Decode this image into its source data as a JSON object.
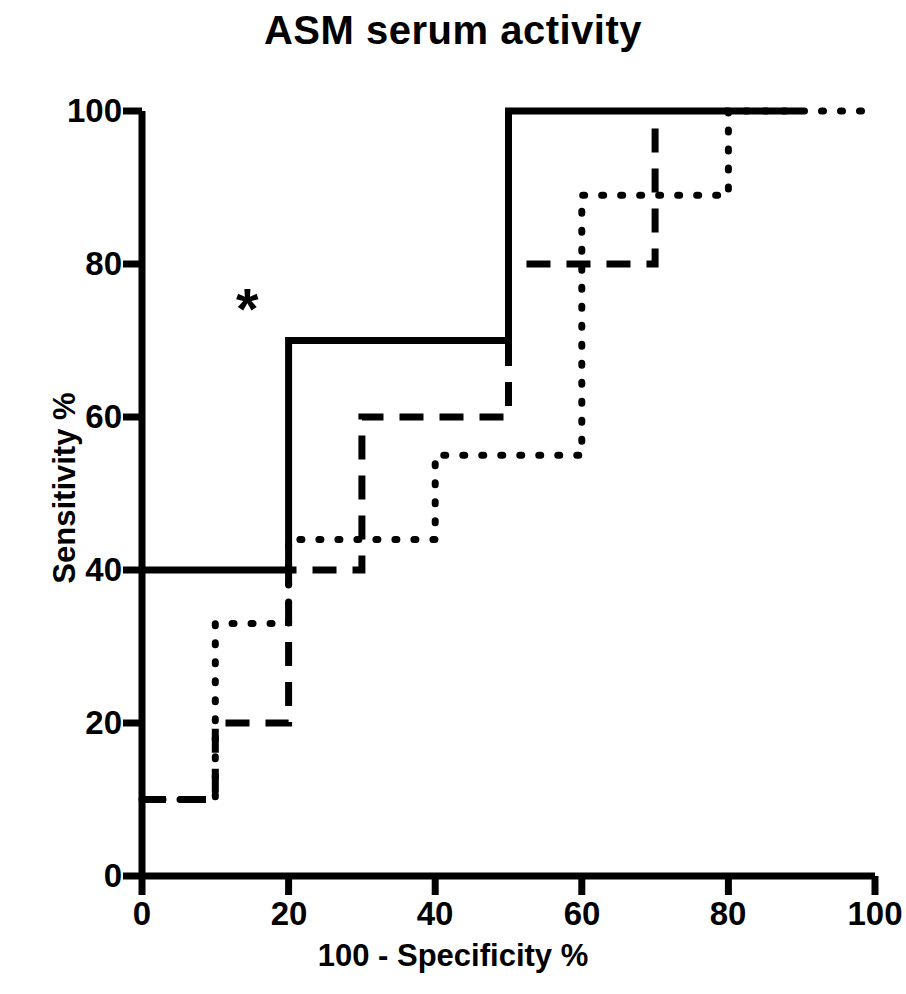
{
  "chart_data": {
    "type": "line",
    "title": "ASM serum activity",
    "xlabel": "100 - Specificity %",
    "ylabel": "Sensitivity %",
    "xlim": [
      0,
      100
    ],
    "ylim": [
      0,
      100
    ],
    "xticks": [
      0,
      20,
      40,
      60,
      80,
      100
    ],
    "yticks": [
      0,
      20,
      40,
      60,
      80,
      100
    ],
    "xtick_labels": [
      "0",
      "20",
      "40",
      "60",
      "80",
      "100"
    ],
    "ytick_labels": [
      "0",
      "20",
      "40",
      "60",
      "80",
      "100"
    ],
    "grid": false,
    "legend": "none",
    "annotations": [
      {
        "text": "*",
        "x": 15,
        "y": 74,
        "name": "significance-asterisk"
      }
    ],
    "series": [
      {
        "name": "solid-roc-curve",
        "style": "solid",
        "color": "#000000",
        "width": 7,
        "points": [
          [
            0,
            40
          ],
          [
            20,
            40
          ],
          [
            20,
            70
          ],
          [
            50,
            70
          ],
          [
            50,
            100
          ],
          [
            90,
            100
          ]
        ]
      },
      {
        "name": "dashed-roc-curve",
        "style": "dashed",
        "color": "#000000",
        "width": 7,
        "points": [
          [
            0,
            10
          ],
          [
            10,
            10
          ],
          [
            10,
            20
          ],
          [
            20,
            20
          ],
          [
            20,
            40
          ],
          [
            30,
            40
          ],
          [
            30,
            60
          ],
          [
            50,
            60
          ],
          [
            50,
            80
          ],
          [
            70,
            80
          ],
          [
            70,
            100
          ]
        ]
      },
      {
        "name": "dotted-roc-curve",
        "style": "dotted",
        "color": "#000000",
        "width": 7,
        "points": [
          [
            0,
            10
          ],
          [
            10,
            10
          ],
          [
            10,
            33
          ],
          [
            20,
            33
          ],
          [
            20,
            44
          ],
          [
            40,
            44
          ],
          [
            40,
            55
          ],
          [
            60,
            55
          ],
          [
            60,
            89
          ],
          [
            80,
            89
          ],
          [
            80,
            100
          ],
          [
            100,
            100
          ]
        ]
      }
    ]
  },
  "axes": {
    "x_ticks": [
      {
        "value": "0",
        "px": 142
      },
      {
        "value": "20",
        "px": 289
      },
      {
        "value": "40",
        "px": 435
      },
      {
        "value": "60",
        "px": 582
      },
      {
        "value": "80",
        "px": 728
      },
      {
        "value": "100",
        "px": 875
      }
    ],
    "y_ticks": [
      {
        "value": "0",
        "px": 876
      },
      {
        "value": "20",
        "px": 723
      },
      {
        "value": "40",
        "px": 570
      },
      {
        "value": "60",
        "px": 417
      },
      {
        "value": "80",
        "px": 264
      },
      {
        "value": "100",
        "px": 111
      }
    ]
  }
}
